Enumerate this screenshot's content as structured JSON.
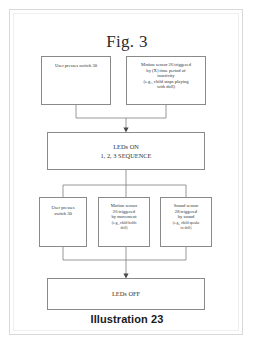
{
  "figure": {
    "title": "Fig. 3",
    "caption": "Illustration 23"
  },
  "nodes": {
    "switch_top": {
      "text": "User presses switch 30"
    },
    "motion_top": {
      "text": "Motion sensor 26 triggered\nby (X) time period of\ninactivity\n(e.g., child stops playing\nwith doll)"
    },
    "leds_on": {
      "text": "LEDs ON\n1, 2, 3 SEQUENCE"
    },
    "switch_mid": {
      "text": "User presses\nswitch 30"
    },
    "motion_mid": {
      "text": "Motion sensor\n26 triggered\nby movement",
      "example": "(e.g., child holds\ndoll)"
    },
    "sound_mid": {
      "text": "Sound sensor\n28 triggered\nby sound",
      "example": "(e.g., child speaks\nto doll)"
    },
    "leds_off": {
      "text": "LEDs OFF"
    }
  },
  "colors": {
    "box_border": "#8a8a8a",
    "wire": "#7d7d7d",
    "text": "#333333",
    "page_border": "#d9d9d9"
  }
}
